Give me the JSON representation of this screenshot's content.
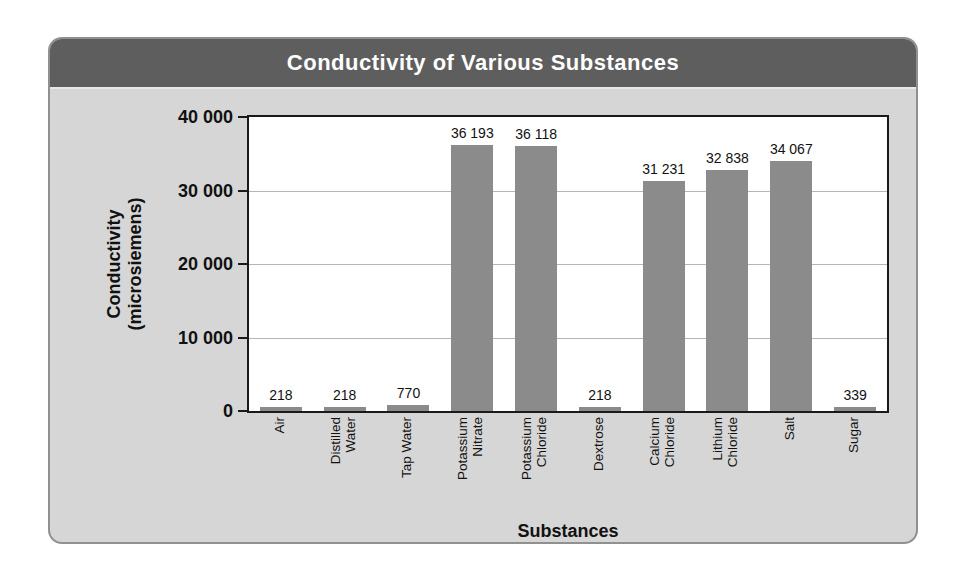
{
  "panel": {
    "title": "Conductivity of Various Substances"
  },
  "chart_data": {
    "type": "bar",
    "title": "Conductivity of Various Substances",
    "xlabel": "Substances",
    "ylabel": "Conductivity (microsiemens)",
    "ylabel_display": "Conductivity\n(microsiemens)",
    "categories": [
      "Air",
      "Distilled Water",
      "Tap Water",
      "Potassium Nitrate",
      "Potassium Chloride",
      "Dextrose",
      "Calcium Chloride",
      "Lithium Chloride",
      "Salt",
      "Sugar"
    ],
    "category_lines": [
      [
        "Air"
      ],
      [
        "Distilled",
        "Water"
      ],
      [
        "Tap Water"
      ],
      [
        "Potassium",
        "Nitrate"
      ],
      [
        "Potassium",
        "Chloride"
      ],
      [
        "Dextrose"
      ],
      [
        "Calcium",
        "Chloride"
      ],
      [
        "Lithium",
        "Chloride"
      ],
      [
        "Salt"
      ],
      [
        "Sugar"
      ]
    ],
    "values": [
      218,
      218,
      770,
      36193,
      36118,
      218,
      31231,
      32838,
      34067,
      339
    ],
    "value_labels": [
      "218",
      "218",
      "770",
      "36 193",
      "36 118",
      "218",
      "31 231",
      "32 838",
      "34 067",
      "339"
    ],
    "ylim": [
      0,
      40000
    ],
    "yticks": [
      0,
      10000,
      20000,
      30000,
      40000
    ],
    "ytick_labels": [
      "0",
      "10 000",
      "20 000",
      "30 000",
      "40 000"
    ],
    "grid": true,
    "legend": "none",
    "colors": {
      "bar": "#8b8b8b",
      "titlebar_bg": "#5e5e5e",
      "titlebar_text": "#ffffff",
      "panel_bg": "#d6d6d6",
      "panel_border": "#909090",
      "plot_bg": "#ffffff",
      "plot_border": "#1a1a1a",
      "gridline": "#b5b5b5"
    }
  }
}
